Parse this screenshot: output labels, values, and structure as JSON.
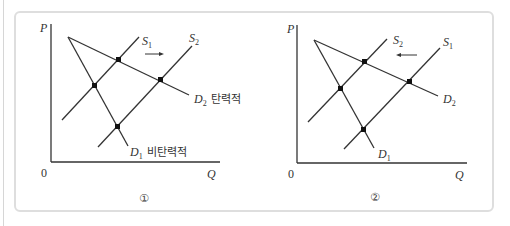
{
  "colors": {
    "line": "#333333",
    "frame": "#dedede",
    "dot": "#111111"
  },
  "panels": [
    {
      "id": "1",
      "caption": "①",
      "axes": {
        "y_label": "P",
        "x_label": "Q",
        "origin": "0"
      },
      "supply_labels": {
        "left": "S",
        "left_sub": "1",
        "right": "S",
        "right_sub": "2"
      },
      "demand_elastic": {
        "label": "D",
        "sub": "2",
        "note": "탄력적"
      },
      "demand_inelastic": {
        "label": "D",
        "sub": "1",
        "note": "비탄력적"
      },
      "shift_arrow": "right"
    },
    {
      "id": "2",
      "caption": "②",
      "axes": {
        "y_label": "P",
        "x_label": "Q",
        "origin": "0"
      },
      "supply_labels": {
        "left": "S",
        "left_sub": "2",
        "right": "S",
        "right_sub": "1"
      },
      "demand_elastic": {
        "label": "D",
        "sub": "2",
        "note": ""
      },
      "demand_inelastic": {
        "label": "D",
        "sub": "1",
        "note": ""
      },
      "shift_arrow": "left"
    }
  ]
}
